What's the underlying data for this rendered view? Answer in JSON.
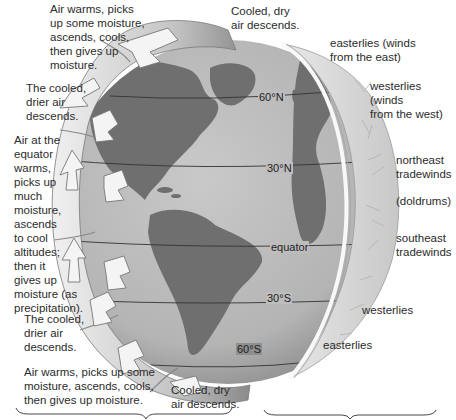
{
  "diagram": {
    "left_labels": [
      {
        "id": "polar-north-rise",
        "text": "Air warms, picks\nup some moisture,\nascends, cools,\nthen gives up\nmoisture."
      },
      {
        "id": "north-descend-top",
        "text": "Cooled, dry\nair descends."
      },
      {
        "id": "north-30-descend",
        "text": "The cooled,\ndrier air\ndescends."
      },
      {
        "id": "equator-rise",
        "text": "Air at the\nequator\nwarms,\npicks up\nmuch\nmoisture,\nascends\nto cool\naltitudes;\nthen it\ngives up\nmoisture (as\nprecipitation)."
      },
      {
        "id": "south-30-descend",
        "text": "The cooled,\ndrier air\ndescends."
      },
      {
        "id": "polar-south-rise",
        "text": "Air warms, picks up some\nmoisture, ascends, cools,\nthen gives up moisture."
      },
      {
        "id": "south-descend-bottom",
        "text": "Cooled, dry\nair descends."
      }
    ],
    "latitude_lines": [
      {
        "label": "60°N"
      },
      {
        "label": "30°N"
      },
      {
        "label": "equator"
      },
      {
        "label": "30°S"
      },
      {
        "label": "60°S"
      }
    ],
    "wind_labels": [
      {
        "id": "easterlies-north",
        "text": "easterlies (winds\nfrom the east)"
      },
      {
        "id": "westerlies-north",
        "text": "westerlies (winds\nfrom the west)"
      },
      {
        "id": "ne-trades",
        "text": "northeast\ntradewinds"
      },
      {
        "id": "doldrums",
        "text": "(doldrums)"
      },
      {
        "id": "se-trades",
        "text": "southeast\ntradewinds"
      },
      {
        "id": "westerlies-south",
        "text": "westerlies"
      },
      {
        "id": "easterlies-south",
        "text": "easterlies"
      }
    ],
    "colors": {
      "globe_ocean": "#bdbdbd",
      "continents": "#6f6f6f",
      "wind_shell": "#d9d9d9",
      "arrow_band": "#d0d0d0",
      "text": "#2b2b2b"
    }
  }
}
